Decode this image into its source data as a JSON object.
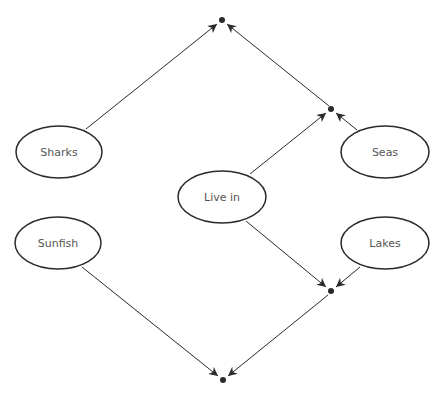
{
  "diagram": {
    "type": "semantic-network",
    "colors": {
      "stroke": "#2a2a2a",
      "label": "#555555",
      "background": "#ffffff"
    },
    "nodes": [
      {
        "id": "sharks",
        "label": "Sharks",
        "cx": 59,
        "cy": 152
      },
      {
        "id": "seas",
        "label": "Seas",
        "cx": 385,
        "cy": 152
      },
      {
        "id": "live_in",
        "label": "Live in",
        "cx": 222,
        "cy": 197
      },
      {
        "id": "sunfish",
        "label": "Sunfish",
        "cx": 58,
        "cy": 243
      },
      {
        "id": "lakes",
        "label": "Lakes",
        "cx": 385,
        "cy": 243
      }
    ],
    "junctions": [
      {
        "id": "top",
        "x": 222,
        "y": 20
      },
      {
        "id": "upper_right",
        "x": 331,
        "y": 109
      },
      {
        "id": "lower_right",
        "x": 331,
        "y": 291
      },
      {
        "id": "bottom",
        "x": 223,
        "y": 380
      }
    ],
    "edges": [
      {
        "from": "sharks",
        "to": "top"
      },
      {
        "from": "upper_right",
        "to": "top"
      },
      {
        "from": "live_in",
        "to": "upper_right"
      },
      {
        "from": "seas",
        "to": "upper_right"
      },
      {
        "from": "live_in",
        "to": "lower_right"
      },
      {
        "from": "lakes",
        "to": "lower_right"
      },
      {
        "from": "sunfish",
        "to": "bottom"
      },
      {
        "from": "lower_right",
        "to": "bottom"
      }
    ]
  }
}
